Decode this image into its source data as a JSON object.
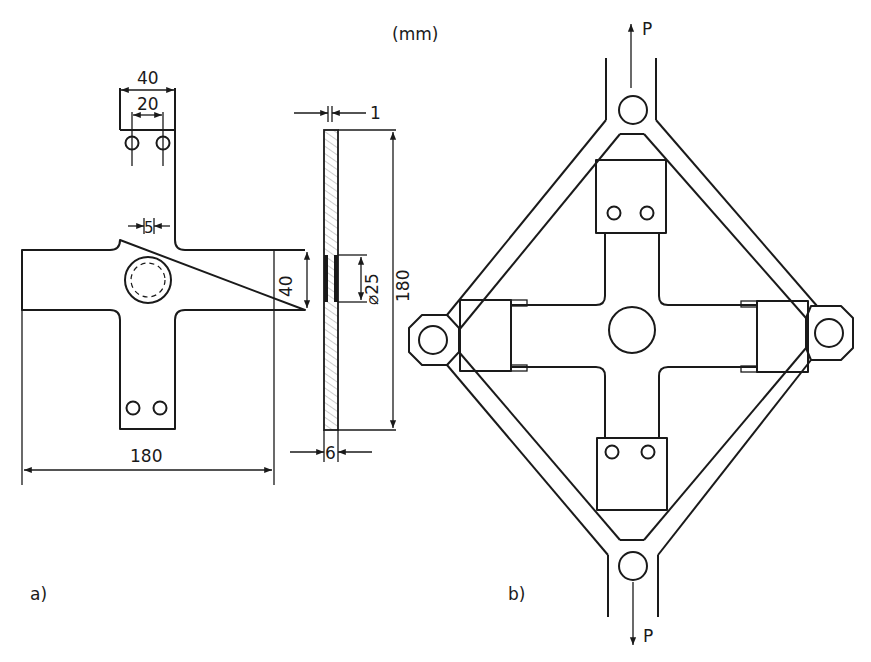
{
  "units_label": "(mm)",
  "figure_a": {
    "label": "a)",
    "dimensions": {
      "tab_width": "40",
      "hole_spacing": "20",
      "fillet_radius": "5",
      "arm_width": "40",
      "overall_length": "180",
      "plate_thickness_top": "1",
      "reinforcement_diameter": "⌀25",
      "side_length": "180",
      "side_thickness": "6"
    }
  },
  "figure_b": {
    "label": "b)",
    "load_top": "P",
    "load_bottom": "P"
  },
  "colors": {
    "line": "#1a1a1a",
    "hatch": "#9a9a9a",
    "background": "#ffffff"
  }
}
